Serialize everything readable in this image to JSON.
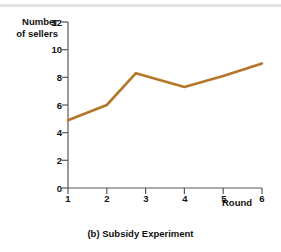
{
  "figure": {
    "caption": "(b) Subsidy Experiment",
    "background_color": "#ffffff",
    "rule_color": "#dfe3e6"
  },
  "chart_data": {
    "type": "line",
    "title": "(b) Subsidy Experiment",
    "xlabel": "Round",
    "ylabel": "Number of sellers",
    "ylabel_line1": "Number",
    "ylabel_line2": "of sellers",
    "x": [
      1,
      2,
      2.75,
      4,
      5,
      6
    ],
    "values": [
      4.9,
      6.0,
      8.3,
      7.3,
      8.1,
      9.0
    ],
    "series": [
      {
        "name": "Number of sellers",
        "color": "#b5762a",
        "x": [
          1,
          2,
          2.75,
          4,
          5,
          6
        ],
        "values": [
          4.9,
          6.0,
          8.3,
          7.3,
          8.1,
          9.0
        ]
      }
    ],
    "xlim": [
      1,
      6
    ],
    "ylim": [
      0,
      12
    ],
    "xticks": [
      1,
      2,
      3,
      4,
      5,
      6
    ],
    "yticks": [
      0,
      2,
      4,
      6,
      8,
      10,
      12
    ],
    "xtick_labels": [
      "1",
      "2",
      "3",
      "4",
      "5",
      "6"
    ],
    "ytick_labels": [
      "0",
      "2",
      "4",
      "6",
      "8",
      "10",
      "12"
    ],
    "grid": false,
    "legend": "none",
    "line_color": "#b5762a",
    "axis_color": "#55585c"
  }
}
